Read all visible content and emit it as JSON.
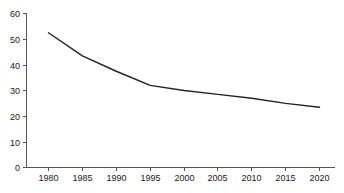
{
  "chart_data": {
    "type": "line",
    "title": "",
    "subtitle": "",
    "xlabel": "",
    "ylabel": "",
    "x": [
      1980,
      1985,
      1990,
      1995,
      2000,
      2005,
      2010,
      2015,
      2020
    ],
    "values": [
      52.5,
      43.5,
      37.5,
      32.0,
      30.0,
      28.5,
      27.0,
      25.0,
      23.5
    ],
    "series": [
      {
        "name": "",
        "values": [
          52.5,
          43.5,
          37.5,
          32.0,
          30.0,
          28.5,
          27.0,
          25.0,
          23.5
        ]
      }
    ],
    "xlim": [
      1978,
      2022
    ],
    "ylim": [
      0,
      60
    ],
    "x_tick_labels": [
      "1980",
      "1985",
      "1990",
      "1995",
      "2000",
      "2005",
      "2010",
      "2015",
      "2020"
    ],
    "y_tick_labels": [
      "0",
      "10",
      "20",
      "30",
      "40",
      "50",
      "60"
    ],
    "y_ticks": [
      0,
      10,
      20,
      30,
      40,
      50,
      60
    ],
    "grid": false,
    "legend": false,
    "legend_position": "none",
    "annotations": [],
    "line_color": "#222222",
    "axis_color": "#555555",
    "background_color": "#ffffff"
  },
  "figure": {
    "note": ""
  }
}
